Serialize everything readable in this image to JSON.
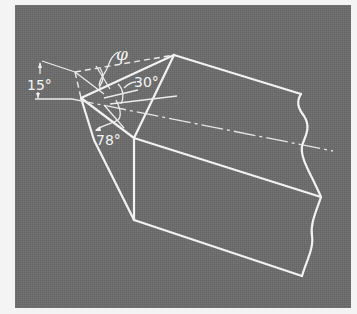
{
  "figure": {
    "background_color": "#6b6b6b",
    "line_color": "#f2f2f2",
    "labels": {
      "phi": "φ",
      "angle_15": "15°",
      "angle_30": "30°",
      "angle_78": "78°"
    }
  }
}
